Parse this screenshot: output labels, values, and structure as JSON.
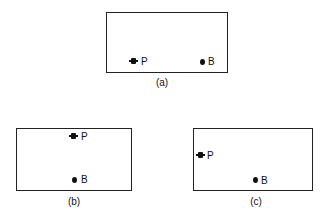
{
  "figure": {
    "panels": [
      {
        "id": "a",
        "caption": "(a)",
        "p_label": "P",
        "b_label": "B"
      },
      {
        "id": "b",
        "caption": "(b)",
        "p_label": "P",
        "b_label": "B"
      },
      {
        "id": "c",
        "caption": "(c)",
        "p_label": "P",
        "b_label": "B"
      }
    ]
  }
}
